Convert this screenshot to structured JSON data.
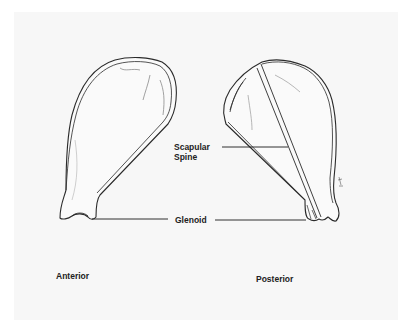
{
  "figure": {
    "views": [
      {
        "name": "Anterior",
        "label": "Anterior"
      },
      {
        "name": "Posterior",
        "label": "Posterior"
      }
    ],
    "annotations": {
      "scapular_spine": [
        "Scapular",
        "Spine"
      ],
      "glenoid": "Glenoid"
    },
    "signature": "TPH"
  },
  "colors": {
    "background": "#f7f7f7",
    "outline": "#2a2a2a",
    "shading": "#9a9a9a",
    "text": "#222222"
  }
}
